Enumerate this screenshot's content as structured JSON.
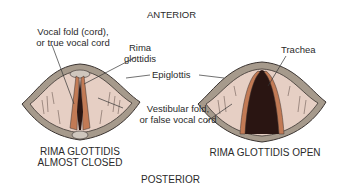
{
  "orientation": {
    "top": "ANTERIOR",
    "bottom": "POSTERIOR"
  },
  "labels": {
    "vocal_fold_line1": "Vocal fold (cord),",
    "vocal_fold_line2": "or true vocal cord",
    "rima_line1": "Rima",
    "rima_line2": "glottidis",
    "epiglottis": "Epiglottis",
    "trachea": "Trachea",
    "vestibular_line1": "Vestibular fold,",
    "vestibular_line2": "or false vocal cord"
  },
  "captions": {
    "left_line1": "RIMA GLOTTIDIS",
    "left_line2": "ALMOST CLOSED",
    "right": "RIMA GLOTTIDIS OPEN"
  },
  "colors": {
    "rim": "#a69a8c",
    "rim_outline": "#3a3330",
    "tissue": "#e6cfc4",
    "fold": "#c27a55",
    "cavity": "#2a1512",
    "leader": "#333333"
  }
}
